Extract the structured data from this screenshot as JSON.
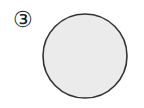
{
  "figure": {
    "label": "③",
    "shape": {
      "type": "circle",
      "cx": 85,
      "cy": 56,
      "r": 42,
      "fill": "#ebebeb",
      "stroke": "#333333",
      "stroke_width": 1.6
    }
  }
}
